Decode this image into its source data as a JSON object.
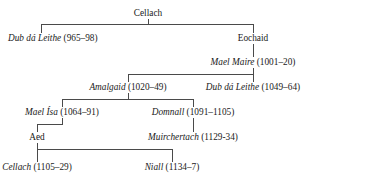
{
  "diagram": {
    "type": "genealogical-tree",
    "line_color": "#4a4a4a",
    "text_color": "#1a1a1a"
  },
  "nodes": [
    {
      "id": "cellach-root",
      "name": "Cellach",
      "dates": "",
      "label": "Cellach",
      "italic": false,
      "generation": 1,
      "x": 148,
      "y": 8,
      "anchor": "center"
    },
    {
      "id": "dub-da-leithe-1",
      "name": "Dub dá Leithe",
      "dates": "(965–98)",
      "label": "Dub dá Leithe (965–98)",
      "italic": true,
      "generation": 2,
      "x": 8,
      "y": 33,
      "anchor": "left"
    },
    {
      "id": "eochaid",
      "name": "Eochaid",
      "dates": "",
      "label": "Eochaid",
      "italic": false,
      "generation": 2,
      "x": 253,
      "y": 33,
      "anchor": "center"
    },
    {
      "id": "mael-maire",
      "name": "Mael Maire",
      "dates": "(1001–20)",
      "label": "Mael Maire (1001–20)",
      "italic": true,
      "generation": 3,
      "x": 253,
      "y": 57,
      "anchor": "center"
    },
    {
      "id": "amalgaid",
      "name": "Amalgaid",
      "dates": "(1020–49)",
      "label": "Amalgaid (1020–49)",
      "italic": true,
      "generation": 4,
      "x": 128,
      "y": 82,
      "anchor": "center"
    },
    {
      "id": "dub-da-leithe-2",
      "name": "Dub dá Leithe",
      "dates": "(1049–64)",
      "label": "Dub dá Leithe (1049–64)",
      "italic": true,
      "generation": 4,
      "x": 253,
      "y": 82,
      "anchor": "center"
    },
    {
      "id": "mael-isa",
      "name": "Mael Ísa",
      "dates": "(1064–91)",
      "label": "Mael Ísa (1064–91)",
      "italic": true,
      "generation": 5,
      "x": 62,
      "y": 107,
      "anchor": "center"
    },
    {
      "id": "domnall",
      "name": "Domnall",
      "dates": "(1091–1105)",
      "label": "Domnall (1091–1105)",
      "italic": true,
      "generation": 5,
      "x": 193,
      "y": 107,
      "anchor": "center"
    },
    {
      "id": "aed",
      "name": "Aed",
      "dates": "",
      "label": "Aed",
      "italic": false,
      "generation": 6,
      "x": 37,
      "y": 132,
      "anchor": "center"
    },
    {
      "id": "muirchertach",
      "name": "Muirchertach",
      "dates": "(1129-34)",
      "label": "Muirchertach (1129-34)",
      "italic": true,
      "generation": 6,
      "x": 193,
      "y": 132,
      "anchor": "center"
    },
    {
      "id": "cellach-2",
      "name": "Cellach",
      "dates": "(1105–29)",
      "label": "Cellach (1105–29)",
      "italic": true,
      "generation": 7,
      "x": 37,
      "y": 162,
      "anchor": "center"
    },
    {
      "id": "niall",
      "name": "Niall",
      "dates": "(1134–7)",
      "label": "Niall (1134–7)",
      "italic": true,
      "generation": 7,
      "x": 172,
      "y": 162,
      "anchor": "center"
    }
  ],
  "edges": {
    "cellach_stem": {
      "x": 148,
      "y": 19,
      "h": 6
    },
    "cellach_bar": {
      "x": 41,
      "y": 24,
      "w": 213
    },
    "cellach_drop_left": {
      "x": 41,
      "y": 24,
      "h": 9
    },
    "cellach_drop_right": {
      "x": 253,
      "y": 24,
      "h": 9
    },
    "eochaid_to_maelmaire": {
      "x": 253,
      "y": 44,
      "h": 13
    },
    "maelmaire_stem": {
      "x": 253,
      "y": 68,
      "h": 6
    },
    "maelmaire_bar": {
      "x": 128,
      "y": 74,
      "w": 126
    },
    "maelmaire_drop_left": {
      "x": 128,
      "y": 74,
      "h": 8
    },
    "maelmaire_drop_right": {
      "x": 253,
      "y": 74,
      "h": 8
    },
    "amalgaid_stem": {
      "x": 128,
      "y": 93,
      "h": 6
    },
    "amalgaid_bar": {
      "x": 62,
      "y": 99,
      "w": 132
    },
    "amalgaid_drop_left": {
      "x": 62,
      "y": 99,
      "h": 8
    },
    "amalgaid_drop_right": {
      "x": 193,
      "y": 99,
      "h": 8
    },
    "maelisa_stem": {
      "x": 62,
      "y": 118,
      "h": 6
    },
    "maelisa_bar": {
      "x": 37,
      "y": 124,
      "w": 26
    },
    "maelisa_drop": {
      "x": 37,
      "y": 124,
      "h": 8
    },
    "domnall_to_muirchertach": {
      "x": 193,
      "y": 118,
      "h": 14
    },
    "aed_stem": {
      "x": 37,
      "y": 143,
      "h": 6
    },
    "aed_bar": {
      "x": 37,
      "y": 149,
      "w": 136
    },
    "aed_drop_left": {
      "x": 37,
      "y": 149,
      "h": 13
    },
    "aed_drop_right": {
      "x": 172,
      "y": 149,
      "h": 13
    }
  }
}
